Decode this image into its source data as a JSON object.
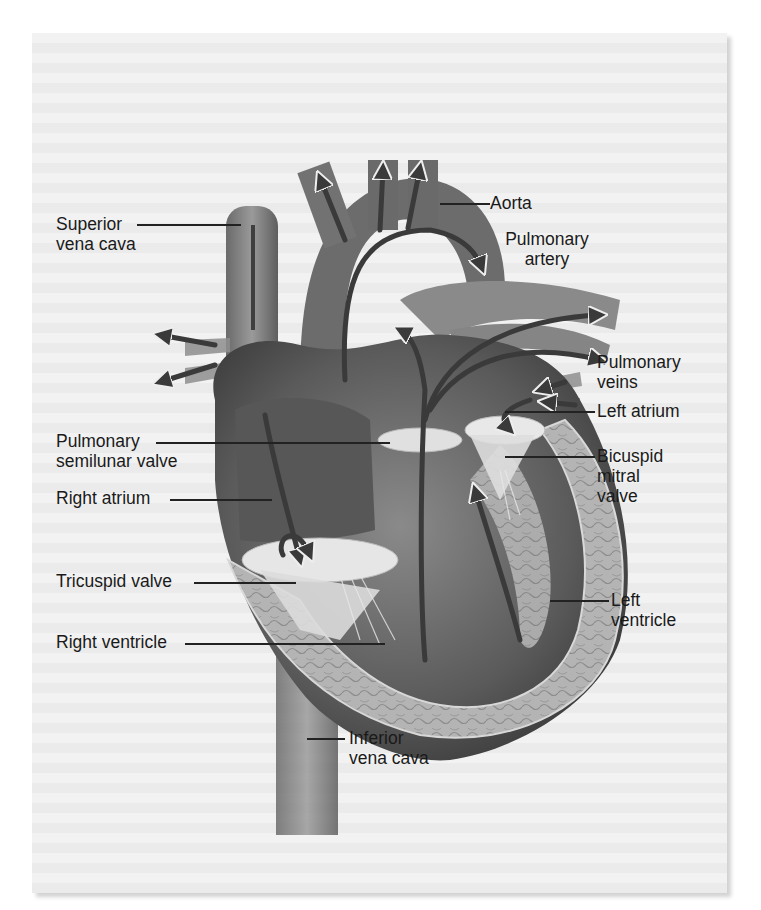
{
  "figure": {
    "colors": {
      "panel_bg": "#f2f2f2",
      "heart_dark": "#4a4a4a",
      "heart_mid": "#7a7a7a",
      "heart_light": "#bdbdbd",
      "valve": "#e8e8e8",
      "label_text": "#1a1a1a"
    }
  },
  "labels": {
    "aorta": "Aorta",
    "superior_vena_cava": "Superior\nvena cava",
    "pulmonary_artery": "Pulmonary\nartery",
    "pulmonary_veins": "Pulmonary\nveins",
    "left_atrium": "Left atrium",
    "pulmonary_semilunar_valve": "Pulmonary\nsemilunar valve",
    "bicuspid_mitral_valve": "Bicuspid\nmitral\nvalve",
    "right_atrium": "Right atrium",
    "tricuspid_valve": "Tricuspid valve",
    "left_ventricle": "Left\nventricle",
    "right_ventricle": "Right ventricle",
    "inferior_vena_cava": "Inferior\nvena cava"
  }
}
